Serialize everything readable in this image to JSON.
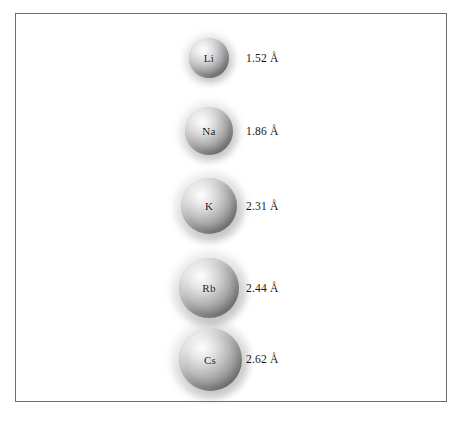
{
  "figure": {
    "background_color": "#ffffff",
    "border_color": "#6e6e6e",
    "unit": "Å"
  },
  "chart_data": {
    "type": "diagram",
    "title": "",
    "subtitle": "",
    "xlabel": "",
    "ylabel": "",
    "legend": [],
    "categories": [
      "Li",
      "Na",
      "K",
      "Rb",
      "Cs"
    ],
    "values": [
      1.52,
      1.86,
      2.31,
      2.44,
      2.62
    ],
    "value_labels": [
      "1.52 Å",
      "1.86 Å",
      "2.31 Å",
      "2.44 Å",
      "2.62 Å"
    ],
    "units": "Å",
    "series": [
      {
        "name": "atomic radius",
        "values": [
          1.52,
          1.86,
          2.31,
          2.44,
          2.62
        ]
      }
    ]
  },
  "atoms": [
    {
      "symbol": "Li",
      "radius_label": "1.52 Å",
      "radius_value": 1.52,
      "diameter_px": 40,
      "cx": 208,
      "cy": 57
    },
    {
      "symbol": "Na",
      "radius_label": "1.86 Å",
      "radius_value": 1.86,
      "diameter_px": 48,
      "cx": 208,
      "cy": 130
    },
    {
      "symbol": "K",
      "radius_label": "2.31 Å",
      "radius_value": 2.31,
      "diameter_px": 56,
      "cx": 208,
      "cy": 205
    },
    {
      "symbol": "Rb",
      "radius_label": "2.44 Å",
      "radius_value": 2.44,
      "diameter_px": 60,
      "cx": 208,
      "cy": 287
    },
    {
      "symbol": "Cs",
      "radius_label": "2.62 Å",
      "radius_value": 2.62,
      "diameter_px": 63,
      "cx": 209,
      "cy": 358
    }
  ],
  "label_column_x": 245
}
